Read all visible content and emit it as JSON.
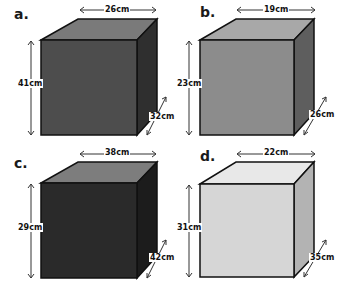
{
  "boxes": [
    {
      "label": "a.",
      "width": "26cm",
      "height": "41cm",
      "depth": "32cm",
      "colors": {
        "front": "#4d4d4d",
        "top": "#7a7a7a",
        "side": "#2f2f2f"
      }
    },
    {
      "label": "b.",
      "width": "19cm",
      "height": "23cm",
      "depth": "26cm",
      "colors": {
        "front": "#8c8c8c",
        "top": "#a8a8a8",
        "side": "#5e5e5e"
      }
    },
    {
      "label": "c.",
      "width": "38cm",
      "height": "29cm",
      "depth": "42cm",
      "colors": {
        "front": "#2a2a2a",
        "top": "#7d7d7d",
        "side": "#1c1c1c"
      }
    },
    {
      "label": "d.",
      "width": "22cm",
      "height": "31cm",
      "depth": "35cm",
      "colors": {
        "front": "#d6d6d6",
        "top": "#e8e8e8",
        "side": "#b3b3b3"
      }
    }
  ]
}
